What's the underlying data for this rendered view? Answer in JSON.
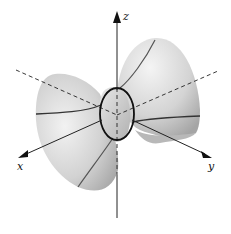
{
  "diagram": {
    "type": "3d-surface",
    "surface": "hyperboloid-of-one-sheet",
    "axes": {
      "x": {
        "label": "x"
      },
      "y": {
        "label": "y"
      },
      "z": {
        "label": "z"
      }
    },
    "colors": {
      "background": "#ffffff",
      "surface_light": "#f0f0f0",
      "surface_mid": "#c8c8c8",
      "surface_dark": "#9a9a9a",
      "curve": "#555555",
      "ellipse": "#111111",
      "axis": "#222222"
    }
  }
}
